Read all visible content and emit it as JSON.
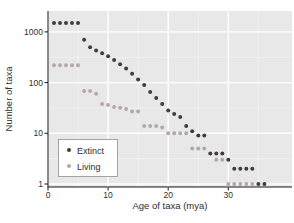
{
  "chart_data": {
    "type": "scatter",
    "title": "",
    "xlabel": "Age of taxa (mya)",
    "ylabel": "Number of taxa",
    "y_scale": "log10",
    "x_ticks": [
      0,
      10,
      20,
      30
    ],
    "x_minor_ticks": [
      5,
      15,
      25,
      35
    ],
    "y_ticks": [
      1,
      10,
      100,
      1000
    ],
    "y_minor_ticks": [
      3.16,
      31.6,
      316
    ],
    "xlim": [
      0,
      40.6
    ],
    "ylim": [
      1,
      3000
    ],
    "grid": "on",
    "legend_position": "bottom-left",
    "panel_color": "#e9e8e8",
    "grid_color": "#ffffff",
    "axis_color": "#161616",
    "text_color": "#2e2e2e",
    "series": [
      {
        "name": "Extinct",
        "color": "#433c3c",
        "points": [
          [
            1,
            1500
          ],
          [
            2,
            1500
          ],
          [
            3,
            1500
          ],
          [
            4,
            1500
          ],
          [
            5,
            1500
          ],
          [
            6,
            700
          ],
          [
            7,
            500
          ],
          [
            8,
            430
          ],
          [
            9,
            380
          ],
          [
            10,
            330
          ],
          [
            11,
            280
          ],
          [
            12,
            230
          ],
          [
            13,
            190
          ],
          [
            14,
            150
          ],
          [
            15,
            115
          ],
          [
            16,
            90
          ],
          [
            17,
            65
          ],
          [
            18,
            50
          ],
          [
            19,
            38
          ],
          [
            20,
            28
          ],
          [
            21,
            24
          ],
          [
            22,
            21
          ],
          [
            23,
            14
          ],
          [
            24,
            11
          ],
          [
            25,
            9
          ],
          [
            26,
            9
          ],
          [
            27,
            4
          ],
          [
            28,
            4
          ],
          [
            29,
            4
          ],
          [
            30,
            3
          ],
          [
            31,
            2
          ],
          [
            32,
            2
          ],
          [
            33,
            2
          ],
          [
            34,
            2
          ],
          [
            35,
            1
          ],
          [
            36,
            1
          ]
        ]
      },
      {
        "name": "Living",
        "color": "#b5a8a8",
        "points": [
          [
            1,
            220
          ],
          [
            2,
            220
          ],
          [
            3,
            220
          ],
          [
            4,
            220
          ],
          [
            5,
            220
          ],
          [
            6,
            68
          ],
          [
            7,
            68
          ],
          [
            8,
            60
          ],
          [
            9,
            38
          ],
          [
            10,
            36
          ],
          [
            11,
            33
          ],
          [
            12,
            32
          ],
          [
            13,
            30
          ],
          [
            14,
            27
          ],
          [
            15,
            27
          ],
          [
            16,
            14
          ],
          [
            17,
            14
          ],
          [
            18,
            14
          ],
          [
            19,
            13
          ],
          [
            20,
            10
          ],
          [
            21,
            10
          ],
          [
            22,
            10
          ],
          [
            23,
            10
          ],
          [
            24,
            5
          ],
          [
            25,
            5
          ],
          [
            26,
            5
          ],
          [
            28,
            3
          ],
          [
            29,
            3
          ],
          [
            30,
            1
          ],
          [
            31,
            1
          ],
          [
            32,
            1
          ],
          [
            33,
            1
          ],
          [
            34,
            1
          ]
        ]
      }
    ]
  }
}
